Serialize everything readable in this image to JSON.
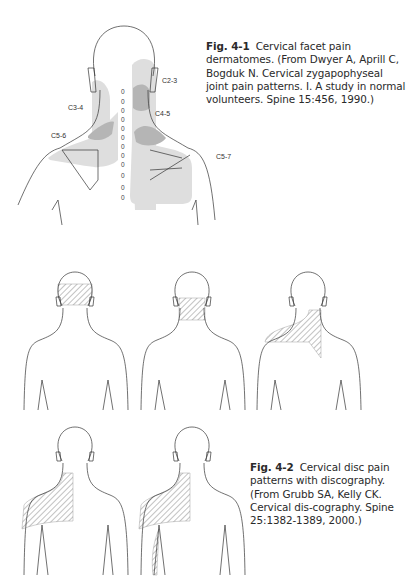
{
  "figure_4_1": {
    "number": "Fig. 4-1",
    "caption": "Cervical facet pain dermatomes. (From Dwyer A, Aprill C, Bogduk N. Cervical zygapophyseal joint pain patterns. I. A study in normal volunteers. Spine 15:456, 1990.)",
    "labels": {
      "c2_3": "C2-3",
      "c3_4": "C3-4",
      "c4_5": "C4-5",
      "c5_6": "C5-6",
      "c5_7": "C5-7"
    },
    "spine_marks": [
      "0",
      "0",
      "0",
      "0",
      "0",
      "0",
      "0",
      "0",
      "0",
      "0",
      "0",
      "0",
      "0"
    ],
    "colors": {
      "light_shade": "#dedede",
      "dark_shade": "#b5b5b5",
      "outline": "#333333"
    }
  },
  "figure_4_2": {
    "number": "Fig. 4-2",
    "caption": "Cervical disc pain patterns with discography. (From Grubb SA, Kelly CK. Cervical dis-cography. Spine 25:1382-1389, 2000.)",
    "panels": [
      {
        "id": "head-occipital",
        "region": "occipital head"
      },
      {
        "id": "neck",
        "region": "posterior neck"
      },
      {
        "id": "neck-shoulder",
        "region": "neck and left shoulder"
      },
      {
        "id": "shoulder-scapula",
        "region": "left shoulder and scapula"
      },
      {
        "id": "shoulder-scapula-arm",
        "region": "left shoulder, scapula and upper arm"
      }
    ]
  }
}
